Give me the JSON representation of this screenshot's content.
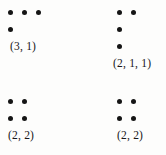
{
  "figure": {
    "kind": "ferrers-diagram-grid",
    "background_color": "#fdfdfc",
    "dot_color": "#151515",
    "text_color": "#17171a",
    "diagrams": [
      {
        "position": "top-left",
        "label": "(3, 1)",
        "rows": [
          3,
          1
        ]
      },
      {
        "position": "top-right",
        "label": "(2, 1, 1)",
        "rows": [
          2,
          1,
          1
        ]
      },
      {
        "position": "bottom-left",
        "label": "(2, 2)",
        "rows": [
          2,
          2
        ]
      },
      {
        "position": "bottom-right",
        "label": "(2, 2)",
        "rows": [
          2,
          2
        ]
      }
    ]
  }
}
